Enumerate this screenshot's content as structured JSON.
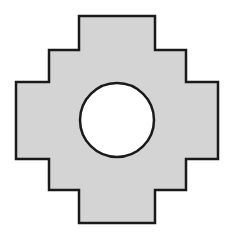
{
  "diagram": {
    "width": 235,
    "height": 238,
    "background": "#ffffff",
    "shape": {
      "type": "stepped-cross",
      "fill": "#d4d4d4",
      "stroke": "#1a1a1a",
      "stroke_width": 2.5,
      "points": "79,16 155,16 155,50 186,50 186,82 218,82 218,159 186,159 186,190 155,190 155,223 79,223 79,190 49,190 49,159 16,159 16,82 49,82 49,50 79,50"
    },
    "hole": {
      "type": "circle",
      "cx": 117,
      "cy": 120,
      "r": 37,
      "fill": "#ffffff",
      "stroke": "#1a1a1a",
      "stroke_width": 2.5
    }
  }
}
